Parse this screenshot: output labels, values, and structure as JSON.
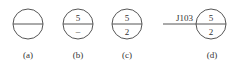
{
  "figure": {
    "symbols": [
      {
        "id": "a",
        "top": "",
        "bottom": "",
        "caption": "(a)"
      },
      {
        "id": "b",
        "top": "5",
        "bottom": "–",
        "caption": "(b)"
      },
      {
        "id": "c",
        "top": "5",
        "bottom": "2",
        "caption": "(c)"
      },
      {
        "id": "d",
        "top": "5",
        "bottom": "2",
        "caption": "(d)",
        "leader_label": "J103"
      }
    ],
    "stroke_color": "#555555"
  }
}
